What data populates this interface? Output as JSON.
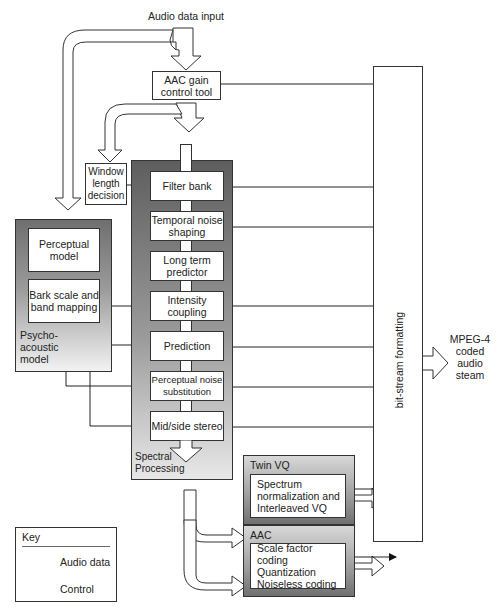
{
  "diagram": {
    "title_input": "Audio data input",
    "gain_control": "AAC gain control tool",
    "window_length": "Window length decision",
    "psychoacoustic": {
      "label": "Psycho-acoustic model",
      "blocks": [
        "Perceptual model",
        "Bark scale and band mapping"
      ]
    },
    "spectral": {
      "label": "Spectral Processing",
      "blocks": [
        "Filter bank",
        "Temporal noise shaping",
        "Long term predictor",
        "Intensity coupling",
        "Prediction",
        "Perceptual noise substitution",
        "Mid/side stereo"
      ]
    },
    "quantization": [
      {
        "label": "Twin VQ",
        "content": "Spectrum normalization and Interleaved VQ"
      },
      {
        "label": "AAC",
        "content": "Scale factor coding Quantization Noiseless coding"
      }
    ],
    "bitstream": "bit-stream formatting",
    "output": "MPEG-4 coded audio steam",
    "key": {
      "title": "Key",
      "items": [
        {
          "icon": "hollow-arrow",
          "label": "Audio data"
        },
        {
          "icon": "control-arrow",
          "label": "Control"
        }
      ]
    },
    "colors": {
      "line": "#222222",
      "panel_dark": "#5e5e5e",
      "panel_light": "#f2f2f2"
    }
  }
}
